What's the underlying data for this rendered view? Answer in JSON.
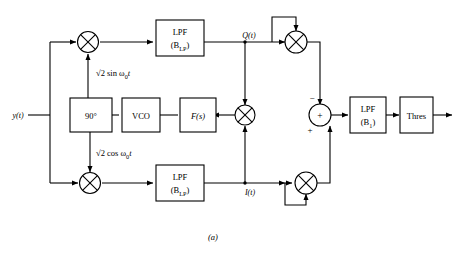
{
  "figure": {
    "caption": "(a)",
    "type": "block-diagram"
  },
  "signals": {
    "input": "y(t)",
    "quadrature": "Q(t)",
    "inphase": "I(t)",
    "carrier_sin": "√2 sin ω",
    "carrier_sin_sub": "0",
    "carrier_sin_tail": "t",
    "carrier_cos": "√2 cos ω",
    "carrier_cos_sub": "0",
    "carrier_cos_tail": "t"
  },
  "blocks": {
    "lpf_top": {
      "label": "LPF",
      "param_open": "(B",
      "param_sub": "LP",
      "param_close": ")"
    },
    "lpf_bottom": {
      "label": "LPF",
      "param_open": "(B",
      "param_sub": "LP",
      "param_close": ")"
    },
    "lpf_out": {
      "label": "LPF",
      "param_open": "(B",
      "param_sub": "1",
      "param_close": ")"
    },
    "thres": {
      "label": "Thres"
    },
    "phase_shift": {
      "label": "90°"
    },
    "vco": {
      "label": "VCO"
    },
    "loop_filter": {
      "label": "F(s)"
    }
  },
  "nodes": {
    "mult_top": {
      "symbol": "⊗",
      "name": "multiplier"
    },
    "mult_bottom": {
      "symbol": "⊗",
      "name": "multiplier"
    },
    "mult_center": {
      "symbol": "⊗",
      "name": "multiplier"
    },
    "square_q": {
      "symbol": "⊗",
      "name": "squarer"
    },
    "square_i": {
      "symbol": "⊗",
      "name": "squarer"
    },
    "summer": {
      "symbol": "+",
      "sign_minus": "−",
      "sign_plus": "+"
    }
  },
  "colors": {
    "line": "#000000",
    "fill": "#ffffff",
    "background": "#ffffff"
  }
}
